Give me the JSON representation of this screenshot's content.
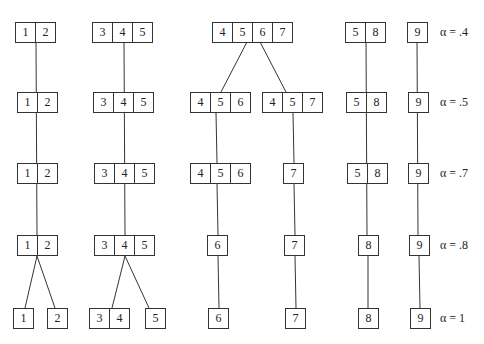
{
  "levels": [
    {
      "alpha": "α = .4",
      "y": 22,
      "groups": [
        {
          "cells": [
            "1",
            "2"
          ],
          "x": 15
        },
        {
          "cells": [
            "3",
            "4",
            "5"
          ],
          "x": 92
        },
        {
          "cells": [
            "4",
            "5",
            "6",
            "7"
          ],
          "x": 212
        },
        {
          "cells": [
            "5",
            "8"
          ],
          "x": 345
        },
        {
          "cells": [
            "9"
          ],
          "x": 407
        }
      ]
    },
    {
      "alpha": "α = .5",
      "y": 92,
      "groups": [
        {
          "cells": [
            "1",
            "2"
          ],
          "x": 17
        },
        {
          "cells": [
            "3",
            "4",
            "5"
          ],
          "x": 93
        },
        {
          "cells": [
            "4",
            "5",
            "6"
          ],
          "x": 190
        },
        {
          "cells": [
            "4",
            "5",
            "7"
          ],
          "x": 262
        },
        {
          "cells": [
            "5",
            "8"
          ],
          "x": 346
        },
        {
          "cells": [
            "9"
          ],
          "x": 408
        }
      ]
    },
    {
      "alpha": "α = .7",
      "y": 163,
      "groups": [
        {
          "cells": [
            "1",
            "2"
          ],
          "x": 17
        },
        {
          "cells": [
            "3",
            "4",
            "5"
          ],
          "x": 94
        },
        {
          "cells": [
            "4",
            "5",
            "6"
          ],
          "x": 190
        },
        {
          "cells": [
            "7"
          ],
          "x": 283
        },
        {
          "cells": [
            "5",
            "8"
          ],
          "x": 347
        },
        {
          "cells": [
            "9"
          ],
          "x": 408
        }
      ]
    },
    {
      "alpha": "α = .8",
      "y": 235,
      "groups": [
        {
          "cells": [
            "1",
            "2"
          ],
          "x": 17
        },
        {
          "cells": [
            "3",
            "4",
            "5"
          ],
          "x": 94
        },
        {
          "cells": [
            "6"
          ],
          "x": 207
        },
        {
          "cells": [
            "7"
          ],
          "x": 284
        },
        {
          "cells": [
            "8"
          ],
          "x": 358
        },
        {
          "cells": [
            "9"
          ],
          "x": 409
        }
      ]
    },
    {
      "alpha": "α = 1",
      "y": 308,
      "groups": [
        {
          "cells": [
            "1"
          ],
          "x": 13
        },
        {
          "cells": [
            "2"
          ],
          "x": 47
        },
        {
          "cells": [
            "3",
            "4"
          ],
          "x": 89
        },
        {
          "cells": [
            "5"
          ],
          "x": 145
        },
        {
          "cells": [
            "6"
          ],
          "x": 208
        },
        {
          "cells": [
            "7"
          ],
          "x": 285
        },
        {
          "cells": [
            "8"
          ],
          "x": 358
        },
        {
          "cells": [
            "9"
          ],
          "x": 410
        }
      ]
    }
  ]
}
